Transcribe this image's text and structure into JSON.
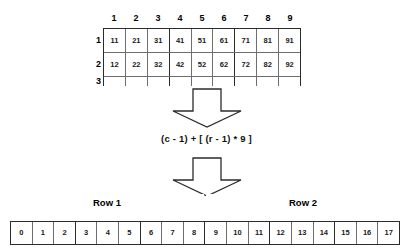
{
  "diagram": {
    "grid": {
      "column_headers": [
        "1",
        "2",
        "3",
        "4",
        "5",
        "6",
        "7",
        "8",
        "9"
      ],
      "row_headers": [
        "1",
        "2",
        "3"
      ],
      "rows": [
        {
          "label": "1",
          "cells": [
            "11",
            "21",
            "31",
            "41",
            "51",
            "61",
            "71",
            "81",
            "91"
          ]
        },
        {
          "label": "2",
          "cells": [
            "12",
            "22",
            "32",
            "42",
            "52",
            "62",
            "72",
            "82",
            "92"
          ]
        },
        {
          "label": "3",
          "cells": [
            "",
            "",
            "",
            "",
            "",
            "",
            "",
            "",
            ""
          ]
        }
      ]
    },
    "arrow_1": {
      "name": "down-block-arrow",
      "direction": "down"
    },
    "formula": "(c - 1) + [ (r - 1) * 9 ]",
    "arrow_2": {
      "name": "down-block-arrow",
      "direction": "down"
    },
    "spans": [
      {
        "label": "Row 1"
      },
      {
        "label": "Row 2"
      }
    ],
    "array_1d": {
      "indices": [
        "0",
        "1",
        "2",
        "3",
        "4",
        "5",
        "6",
        "7",
        "8",
        "9",
        "10",
        "11",
        "12",
        "13",
        "14",
        "15",
        "16",
        "17"
      ]
    },
    "colors": {
      "line_heavy": "#2b2b2b",
      "line_light": "#6e6e6e",
      "text": "#111111",
      "background": "#ffffff"
    }
  }
}
